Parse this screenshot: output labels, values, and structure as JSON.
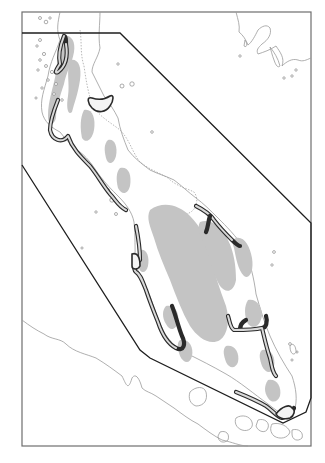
{
  "map": {
    "title": "",
    "frame": {
      "x": 22,
      "y": 12,
      "width": 289,
      "height": 434
    },
    "colors": {
      "background": "#ffffff",
      "frame": "#6e6e6e",
      "coastline": "#9a9a9a",
      "highland_shading": "#c4c4c4",
      "zone_outline": "#2a2a2a",
      "boundary_polygon": "#1e1e1e"
    },
    "boundary_polygon": [
      [
        22,
        33
      ],
      [
        120,
        33
      ],
      [
        311,
        223
      ],
      [
        311,
        398
      ],
      [
        306,
        412
      ],
      [
        283,
        423
      ],
      [
        150,
        358
      ],
      [
        140,
        350
      ],
      [
        22,
        165
      ]
    ],
    "legend": [],
    "labels": []
  }
}
